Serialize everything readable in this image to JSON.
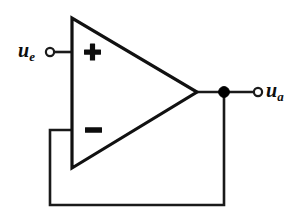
{
  "diagram": {
    "background_color": "#ffffff",
    "line_color": "#1a1a1a",
    "component": {
      "name": "operational-amplifier",
      "symbol": "triangle",
      "inputs": [
        {
          "id": "non-inverting",
          "polarity_glyph": "+",
          "label_text": "u",
          "label_subscript": "e"
        },
        {
          "id": "inverting",
          "polarity_glyph": "−",
          "label_text": "",
          "label_subscript": ""
        }
      ],
      "output": {
        "id": "output",
        "label_text": "u",
        "label_subscript": "a"
      }
    },
    "labels": {
      "input": {
        "base": "u",
        "sub": "e"
      },
      "output": {
        "base": "u",
        "sub": "a"
      }
    },
    "polarity": {
      "plus": "+",
      "minus": "−"
    },
    "nodes": {
      "input_terminal": "open-circle",
      "output_terminal": "open-circle",
      "output_junction": "filled-dot"
    },
    "connections": [
      "input terminal to non-inverting (+) input",
      "amplifier output to output terminal",
      "output junction down and around to inverting (−) input (feedback)"
    ]
  }
}
